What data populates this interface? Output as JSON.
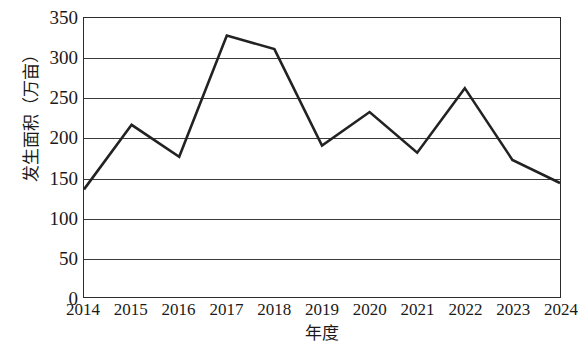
{
  "chart_data": {
    "type": "line",
    "title": "",
    "xlabel": "年度",
    "ylabel": "发生面积（万亩）",
    "categories": [
      "2014",
      "2015",
      "2016",
      "2017",
      "2018",
      "2019",
      "2020",
      "2021",
      "2022",
      "2023",
      "2024"
    ],
    "values": [
      135,
      216,
      176,
      328,
      311,
      190,
      232,
      181,
      262,
      172,
      143
    ],
    "series": [
      {
        "name": "发生面积",
        "values": [
          135,
          216,
          176,
          328,
          311,
          190,
          232,
          181,
          262,
          172,
          143
        ]
      }
    ],
    "ylim": [
      0,
      350
    ],
    "y_ticks": [
      0,
      50,
      100,
      150,
      200,
      250,
      300,
      350
    ],
    "y_tick_labels": [
      "0",
      "50",
      "100",
      "150",
      "200",
      "250",
      "300",
      "350"
    ],
    "x_tick_labels": [
      "2014",
      "2015",
      "2016",
      "2017",
      "2018",
      "2019",
      "2020",
      "2021",
      "2022",
      "2023",
      "2024"
    ],
    "grid": true,
    "grid_axis": "y",
    "legend": false,
    "legend_position": "none",
    "line_color": "#222222",
    "line_width": 2.6,
    "markers": false,
    "background_color": "#ffffff",
    "axis_color": "#2b2b2b"
  }
}
